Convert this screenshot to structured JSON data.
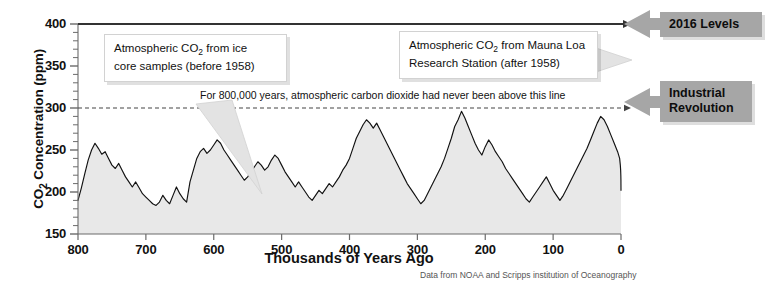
{
  "chart_data": {
    "type": "area",
    "title": "",
    "xlabel": "Thousands of Years Ago",
    "ylabel": "CO2 Concentration (ppm)",
    "ylabel_rich": "CO₂ Concentration (ppm)",
    "xlim": [
      800,
      0
    ],
    "ylim": [
      150,
      400
    ],
    "x_ticks": [
      800,
      700,
      600,
      500,
      400,
      300,
      200,
      100,
      0
    ],
    "y_ticks": [
      150,
      200,
      250,
      300,
      350,
      400
    ],
    "y_minor_tick_step": 10,
    "x_axis_reversed": true,
    "grid": false,
    "legend": "none",
    "series_name": "Atmospheric CO2 concentration",
    "fill_color": "#e8e8e8",
    "line_color": "#111111",
    "reference_lines": [
      {
        "name": "2016-level-line",
        "y": 400,
        "style": "solid",
        "color": "#333333",
        "arrow": "right"
      },
      {
        "name": "pre-industrial-threshold-line",
        "y": 300,
        "style": "dashed",
        "color": "#444444",
        "arrow": "right"
      }
    ],
    "x": [
      800,
      795,
      790,
      785,
      780,
      775,
      770,
      765,
      760,
      755,
      750,
      745,
      740,
      735,
      730,
      725,
      720,
      715,
      710,
      705,
      700,
      695,
      690,
      685,
      680,
      675,
      670,
      665,
      660,
      655,
      650,
      645,
      640,
      635,
      630,
      625,
      620,
      615,
      610,
      605,
      600,
      595,
      590,
      585,
      580,
      575,
      570,
      565,
      560,
      555,
      550,
      545,
      540,
      535,
      530,
      525,
      520,
      515,
      510,
      505,
      500,
      495,
      490,
      485,
      480,
      475,
      470,
      465,
      460,
      455,
      450,
      445,
      440,
      435,
      430,
      425,
      420,
      415,
      410,
      405,
      400,
      395,
      390,
      385,
      380,
      375,
      370,
      365,
      360,
      355,
      350,
      345,
      340,
      335,
      330,
      325,
      320,
      315,
      310,
      305,
      300,
      295,
      290,
      285,
      280,
      275,
      270,
      265,
      260,
      255,
      250,
      245,
      240,
      235,
      230,
      225,
      220,
      215,
      210,
      205,
      200,
      195,
      190,
      185,
      180,
      175,
      170,
      165,
      160,
      155,
      150,
      145,
      140,
      135,
      130,
      125,
      120,
      115,
      110,
      105,
      100,
      95,
      90,
      85,
      80,
      75,
      70,
      65,
      60,
      55,
      50,
      45,
      40,
      35,
      30,
      25,
      20,
      15,
      10,
      5,
      2,
      1,
      0.5,
      0.25,
      0.1,
      0.06,
      0
    ],
    "y": [
      190,
      205,
      222,
      238,
      250,
      258,
      252,
      245,
      248,
      240,
      232,
      228,
      234,
      226,
      218,
      212,
      206,
      212,
      205,
      198,
      194,
      190,
      186,
      184,
      188,
      196,
      190,
      186,
      196,
      206,
      198,
      192,
      188,
      212,
      226,
      240,
      248,
      252,
      246,
      250,
      256,
      262,
      258,
      250,
      244,
      238,
      232,
      226,
      220,
      214,
      218,
      224,
      230,
      236,
      232,
      226,
      230,
      238,
      244,
      240,
      232,
      224,
      218,
      212,
      206,
      212,
      206,
      200,
      194,
      190,
      196,
      202,
      198,
      204,
      210,
      206,
      212,
      218,
      226,
      232,
      240,
      252,
      264,
      272,
      280,
      286,
      282,
      276,
      282,
      274,
      266,
      258,
      250,
      242,
      234,
      226,
      218,
      210,
      204,
      198,
      192,
      186,
      190,
      198,
      206,
      214,
      222,
      230,
      240,
      252,
      264,
      278,
      286,
      296,
      288,
      278,
      268,
      258,
      250,
      244,
      254,
      262,
      256,
      248,
      242,
      236,
      228,
      222,
      216,
      210,
      204,
      198,
      192,
      188,
      194,
      200,
      206,
      212,
      218,
      210,
      202,
      196,
      190,
      196,
      204,
      212,
      220,
      228,
      236,
      244,
      252,
      262,
      272,
      282,
      290,
      286,
      278,
      268,
      258,
      248,
      240,
      232,
      226,
      220,
      214,
      208,
      202,
      196,
      190,
      196,
      202,
      208,
      214,
      208,
      202,
      196,
      190,
      186,
      190,
      196,
      202,
      208,
      214,
      220,
      214,
      208,
      202,
      196,
      192,
      188,
      194,
      200,
      206,
      212,
      206,
      200,
      194,
      190,
      196,
      202,
      196,
      190,
      186,
      192,
      198,
      204,
      198,
      192,
      186,
      190,
      196,
      202,
      208,
      214,
      220,
      226,
      232,
      240,
      250,
      262,
      272,
      268,
      262,
      270,
      278,
      290,
      320,
      350,
      380,
      400,
      404
    ],
    "annotations": [
      {
        "name": "ice-core-callout",
        "text": "Atmospheric CO₂ from ice core samples (before 1958)",
        "points_to_x": 470,
        "points_to_y": 235
      },
      {
        "name": "mauna-loa-callout",
        "text": "Atmospheric CO₂ from Mauna Loa Research Station (after 1958)",
        "points_to_x": 0,
        "points_to_y": 350
      },
      {
        "name": "threshold-note",
        "text": "For 800,000 years, atmospheric carbon dioxide had never been above this line",
        "at_y": 300
      },
      {
        "name": "label-2016-levels",
        "text": "2016 Levels",
        "at_y": 400
      },
      {
        "name": "label-industrial-revolution",
        "text": "Industrial Revolution",
        "at_y": 300
      }
    ]
  },
  "axes": {
    "y_title_prefix": "CO",
    "y_title_sub": "2",
    "y_title_suffix": " Concentration (ppm)",
    "x_title": "Thousands of Years Ago",
    "y_tick_labels": [
      "400",
      "350",
      "300",
      "250",
      "200",
      "150"
    ],
    "x_tick_labels": [
      "800",
      "700",
      "600",
      "500",
      "400",
      "300",
      "200",
      "100",
      "0"
    ]
  },
  "callouts": {
    "ice_core": {
      "line1_a": "Atmospheric CO",
      "line1_sub": "2",
      "line1_b": " from ice",
      "line2": "core samples (before 1958)"
    },
    "mauna_loa": {
      "line1_a": "Atmospheric CO",
      "line1_sub": "2",
      "line1_b": " from Mauna Loa",
      "line2": "Research Station (after 1958)"
    }
  },
  "threshold_note": "For 800,000 years, atmospheric carbon dioxide had never been above this line",
  "side_labels": {
    "levels_2016": "2016 Levels",
    "industrial_revolution_line1": "Industrial",
    "industrial_revolution_line2": "Revolution"
  },
  "source_note": "Data from NOAA and Scripps institution of Oceanography",
  "colors": {
    "fill": "#e8e8e8",
    "line": "#111111",
    "label_box": "#a6a6a6",
    "reference": "#333333"
  }
}
